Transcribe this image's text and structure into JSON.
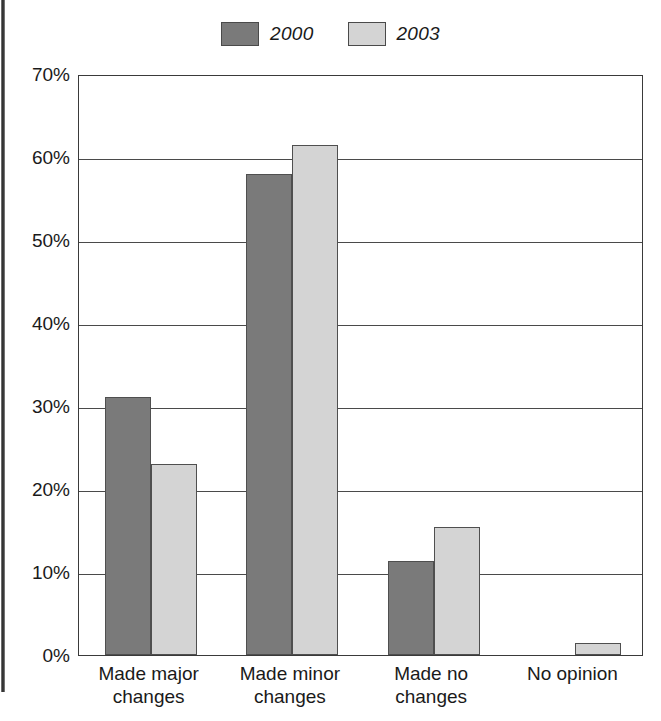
{
  "chart_data": {
    "type": "bar",
    "title": "",
    "xlabel": "",
    "ylabel": "",
    "ylim": [
      0,
      70
    ],
    "ytick_labels": [
      "70%",
      "60%",
      "50%",
      "40%",
      "30%",
      "20%",
      "10%",
      "0%"
    ],
    "ytick_values": [
      70,
      60,
      50,
      40,
      30,
      20,
      10,
      0
    ],
    "grid": true,
    "legend_position": "top-center",
    "categories": [
      "Made major changes",
      "Made minor changes",
      "Made no changes",
      "No opinion"
    ],
    "category_lines": [
      [
        "Made major",
        "changes"
      ],
      [
        "Made minor",
        "changes"
      ],
      [
        "Made no",
        "changes"
      ],
      [
        "No opinion",
        ""
      ]
    ],
    "series": [
      {
        "name": "2000",
        "color": "#7a7a7a",
        "values": [
          31.1,
          58.0,
          11.3,
          null
        ]
      },
      {
        "name": "2003",
        "color": "#d4d4d4",
        "values": [
          23.0,
          61.5,
          15.4,
          1.5
        ]
      }
    ]
  }
}
